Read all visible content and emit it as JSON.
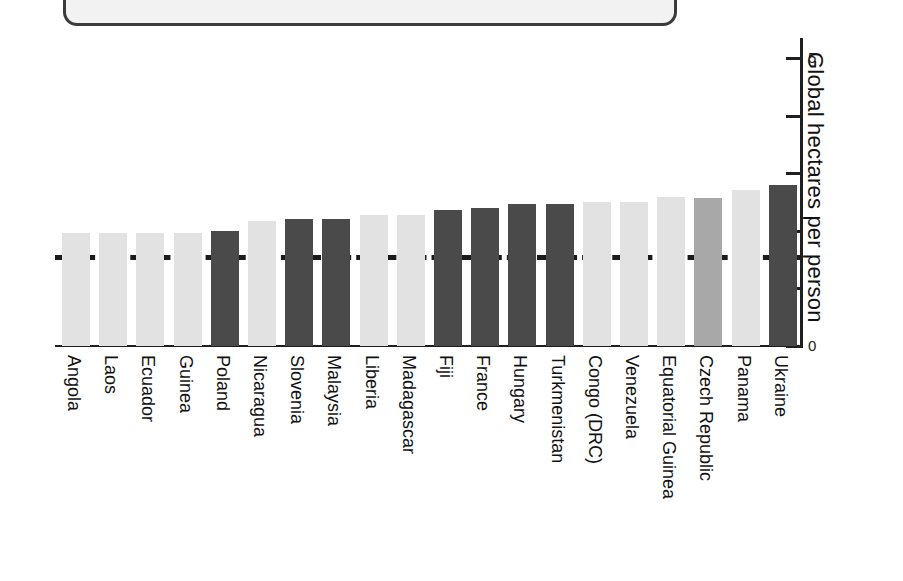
{
  "top_panel": {
    "name": "cut-off-caption-panel"
  },
  "chart_data": {
    "type": "bar",
    "title": "",
    "subtitle": "",
    "xlabel": "",
    "ylabel": "Global hectares per person",
    "ylim": [
      0,
      5
    ],
    "yticks": [
      0,
      1,
      2,
      3,
      4,
      5
    ],
    "ytick_labels": [
      "0",
      "",
      "",
      "",
      "",
      "5"
    ],
    "grid": false,
    "legend": "none",
    "orientation": "vertical",
    "reference_line": {
      "label": "",
      "value": 1.58,
      "style": "dashed"
    },
    "categories": [
      "Angola",
      "Laos",
      "Ecuador",
      "Guinea",
      "Poland",
      "Nicaragua",
      "Slovenia",
      "Malaysia",
      "Liberia",
      "Madagascar",
      "Fiji",
      "France",
      "Hungary",
      "Turkmenistan",
      "Congo (DRC)",
      "Venezuela",
      "Equatorial Guinea",
      "Czech Republic",
      "Panama",
      "Ukraine"
    ],
    "values": [
      1.96,
      1.96,
      1.96,
      1.96,
      2.0,
      2.17,
      2.21,
      2.21,
      2.28,
      2.28,
      2.36,
      2.4,
      2.47,
      2.47,
      2.5,
      2.5,
      2.59,
      2.57,
      2.71,
      2.8
    ],
    "bar_colors": [
      "#e2e2e2",
      "#e2e2e2",
      "#e2e2e2",
      "#e2e2e2",
      "#4a4a4a",
      "#e2e2e2",
      "#4a4a4a",
      "#4a4a4a",
      "#e2e2e2",
      "#e2e2e2",
      "#4a4a4a",
      "#4a4a4a",
      "#4a4a4a",
      "#4a4a4a",
      "#e2e2e2",
      "#e2e2e2",
      "#e2e2e2",
      "#a8a8a8",
      "#e2e2e2",
      "#4a4a4a"
    ]
  },
  "colors": {
    "light_bar": "#e2e2e2",
    "mid_bar": "#a8a8a8",
    "dark_bar": "#4a4a4a",
    "axis": "#1f1f1f",
    "text": "#111111",
    "panel_border": "#3b3b3b",
    "panel_fill": "#f2f2f2"
  }
}
